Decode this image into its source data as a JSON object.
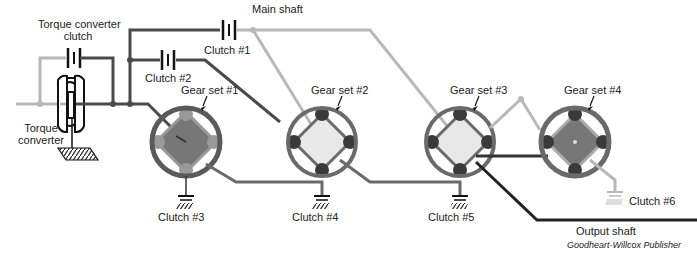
{
  "diagram": {
    "colors": {
      "dark_line": "#4a4a4a",
      "light_line": "#b8b8b8",
      "ring": "#707070",
      "carrier_dark": "#777777",
      "carrier_light": "#e8e8e8",
      "planet": "#3a3a3a",
      "black": "#111111"
    },
    "labels": {
      "tcc": "Torque converter\nclutch",
      "tcc_line1": "Torque converter",
      "tcc_line2": "clutch",
      "tc_line1": "Torque",
      "tc_line2": "converter",
      "main_shaft": "Main shaft",
      "clutch1": "Clutch #1",
      "clutch2": "Clutch #2",
      "clutch3": "Clutch #3",
      "clutch4": "Clutch #4",
      "clutch5": "Clutch #5",
      "clutch6": "Clutch #6",
      "gear1": "Gear set #1",
      "gear2": "Gear set #2",
      "gear3": "Gear set #3",
      "gear4": "Gear set #4",
      "output_shaft": "Output shaft",
      "credit": "Goodheart-Willcox Publisher"
    },
    "gear_sets": [
      {
        "name": "Gear set #1",
        "cx": 186,
        "cy": 142,
        "carrier": "dark"
      },
      {
        "name": "Gear set #2",
        "cx": 322,
        "cy": 142,
        "carrier": "light"
      },
      {
        "name": "Gear set #3",
        "cx": 460,
        "cy": 142,
        "carrier": "light"
      },
      {
        "name": "Gear set #4",
        "cx": 575,
        "cy": 142,
        "carrier": "dark"
      }
    ],
    "clutches": [
      {
        "name": "Clutch #1",
        "type": "band-clutch"
      },
      {
        "name": "Clutch #2",
        "type": "band-clutch"
      },
      {
        "name": "Clutch #3",
        "type": "ground-brake"
      },
      {
        "name": "Clutch #4",
        "type": "ground-brake"
      },
      {
        "name": "Clutch #5",
        "type": "ground-brake"
      },
      {
        "name": "Clutch #6",
        "type": "ground-brake"
      }
    ]
  }
}
